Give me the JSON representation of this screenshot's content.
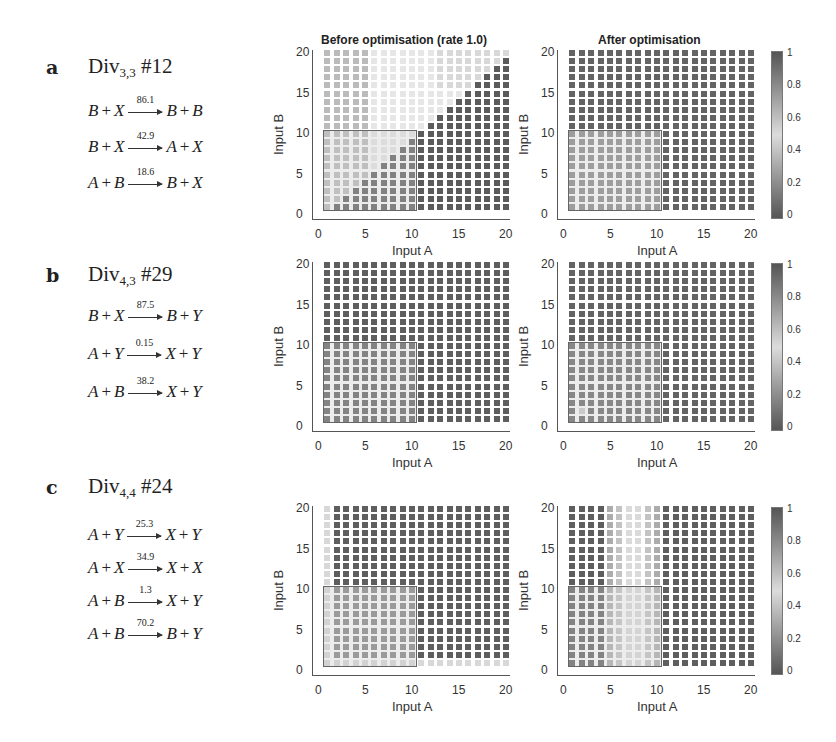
{
  "figure": {
    "column_titles": {
      "before": "Before optimisation (rate 1.0)",
      "after": "After optimisation"
    },
    "axes": {
      "xlabel": "Input A",
      "ylabel": "Input B",
      "xticks": [
        "0",
        "5",
        "10",
        "15",
        "20"
      ],
      "yticks": [
        "0",
        "5",
        "10",
        "15",
        "20"
      ],
      "range": [
        0,
        20
      ],
      "roi": {
        "x": [
          0.5,
          10.5
        ],
        "y": [
          0.5,
          10.5
        ]
      }
    },
    "colorbar": {
      "ticks": [
        "0",
        "0.2",
        "0.4",
        "0.6",
        "0.8",
        "1"
      ],
      "range": [
        0,
        1
      ],
      "colors": {
        "low": "#555555",
        "mid": "#dcdcdc",
        "high": "#555555"
      }
    }
  },
  "panels": [
    {
      "letter": "a",
      "name": "Div",
      "subscript": "3,3",
      "id": "#12",
      "reactions": [
        {
          "lhs": [
            "B",
            "X"
          ],
          "rate": "86.1",
          "rhs": [
            "B",
            "B"
          ]
        },
        {
          "lhs": [
            "B",
            "X"
          ],
          "rate": "42.9",
          "rhs": [
            "A",
            "X"
          ]
        },
        {
          "lhs": [
            "A",
            "B"
          ],
          "rate": "18.6",
          "rhs": [
            "B",
            "X"
          ]
        }
      ]
    },
    {
      "letter": "b",
      "name": "Div",
      "subscript": "4,3",
      "id": "#29",
      "reactions": [
        {
          "lhs": [
            "B",
            "X"
          ],
          "rate": "87.5",
          "rhs": [
            "B",
            "Y"
          ]
        },
        {
          "lhs": [
            "A",
            "Y"
          ],
          "rate": "0.15",
          "rhs": [
            "X",
            "Y"
          ]
        },
        {
          "lhs": [
            "A",
            "B"
          ],
          "rate": "38.2",
          "rhs": [
            "X",
            "Y"
          ]
        }
      ]
    },
    {
      "letter": "c",
      "name": "Div",
      "subscript": "4,4",
      "id": "#24",
      "reactions": [
        {
          "lhs": [
            "A",
            "Y"
          ],
          "rate": "25.3",
          "rhs": [
            "X",
            "Y"
          ]
        },
        {
          "lhs": [
            "A",
            "X"
          ],
          "rate": "34.9",
          "rhs": [
            "X",
            "X"
          ]
        },
        {
          "lhs": [
            "A",
            "B"
          ],
          "rate": "1.3",
          "rhs": [
            "X",
            "Y"
          ]
        },
        {
          "lhs": [
            "A",
            "B"
          ],
          "rate": "70.2",
          "rhs": [
            "B",
            "Y"
          ]
        }
      ]
    }
  ],
  "chart_data": [
    {
      "type": "heatmap",
      "panel": "a",
      "title": "Before optimisation (rate 1.0)",
      "xlabel": "Input A",
      "ylabel": "Input B",
      "xlim": [
        0,
        20
      ],
      "ylim": [
        0,
        20
      ],
      "pattern": "diagonal: light (≈0.5) above A≈B diagonal towards upper-left/center, dark (≈0 or 1) below diagonal A>B",
      "grid": "A,B in 1..20"
    },
    {
      "type": "heatmap",
      "panel": "a",
      "title": "After optimisation",
      "xlabel": "Input A",
      "ylabel": "Input B",
      "xlim": [
        0,
        20
      ],
      "ylim": [
        0,
        20
      ],
      "pattern": "mostly dark everywhere",
      "colorbar": [
        0,
        1
      ]
    },
    {
      "type": "heatmap",
      "panel": "b",
      "title": "",
      "xlabel": "Input A",
      "ylabel": "Input B",
      "xlim": [
        0,
        20
      ],
      "ylim": [
        0,
        20
      ],
      "pattern": "uniformly dark"
    },
    {
      "type": "heatmap",
      "panel": "b",
      "title": "",
      "xlabel": "Input A",
      "ylabel": "Input B",
      "xlim": [
        0,
        20
      ],
      "ylim": [
        0,
        20
      ],
      "pattern": "mostly dark, slight lighter cell near A=2,B=2",
      "colorbar": [
        0,
        1
      ]
    },
    {
      "type": "heatmap",
      "panel": "c",
      "title": "",
      "xlabel": "Input A",
      "ylabel": "Input B",
      "xlim": [
        0,
        20
      ],
      "ylim": [
        0,
        20
      ],
      "pattern": "light column at A=1 and light row at B=1, otherwise dark"
    },
    {
      "type": "heatmap",
      "panel": "c",
      "title": "",
      "xlabel": "Input A",
      "ylabel": "Input B",
      "xlim": [
        0,
        20
      ],
      "ylim": [
        0,
        20
      ],
      "pattern": "light vertical band around A≈5-10 across all B, dark elsewhere",
      "colorbar": [
        0,
        1
      ]
    }
  ]
}
